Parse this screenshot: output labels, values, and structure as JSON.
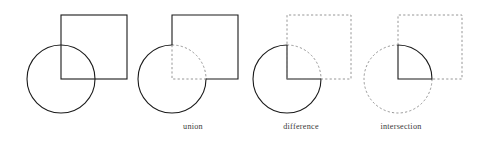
{
  "figure": {
    "background_color": "#ffffff",
    "stroke_color": "#1a1a1a",
    "dashed_color": "#8a8a8a",
    "solid_stroke_width": 1.1,
    "dashed_stroke_width": 0.9,
    "dash_pattern": "2.2 2.2",
    "width": 489,
    "height": 144
  },
  "geometry": {
    "circle_radius": 34,
    "square_size": 66,
    "note": "square bottom-left corner coincides with circle center"
  },
  "panels": [
    {
      "id": "overlap",
      "label": "",
      "label_x": 0,
      "label_y": 0,
      "circle": {
        "cx": 61,
        "cy": 79,
        "r": 34,
        "style": "solid"
      },
      "square": {
        "x": 61,
        "y": 15,
        "w": 66,
        "h": 64,
        "style": "solid"
      },
      "highlight": "none"
    },
    {
      "id": "union",
      "label": "union",
      "label_x": 193,
      "label_y": 129,
      "circle": {
        "cx": 172,
        "cy": 79,
        "r": 34,
        "style": "mixed"
      },
      "square": {
        "x": 172,
        "y": 15,
        "w": 66,
        "h": 64,
        "style": "mixed"
      },
      "highlight": "outer boundary solid, interior overlap edges dashed"
    },
    {
      "id": "difference",
      "label": "difference",
      "label_x": 301,
      "label_y": 129,
      "circle": {
        "cx": 287,
        "cy": 79,
        "r": 34,
        "style": "mixed"
      },
      "square": {
        "x": 287,
        "y": 15,
        "w": 64,
        "h": 64,
        "style": "dashed"
      },
      "highlight": "circle minus square: pac-man shape solid"
    },
    {
      "id": "intersection",
      "label": "intersection",
      "label_x": 401,
      "label_y": 129,
      "circle": {
        "cx": 398,
        "cy": 79,
        "r": 34,
        "style": "dashed"
      },
      "square": {
        "x": 398,
        "y": 15,
        "w": 64,
        "h": 64,
        "style": "dashed"
      },
      "highlight": "quarter disc solid"
    }
  ],
  "labels": {
    "union": "union",
    "difference": "difference",
    "intersection": "intersection"
  }
}
